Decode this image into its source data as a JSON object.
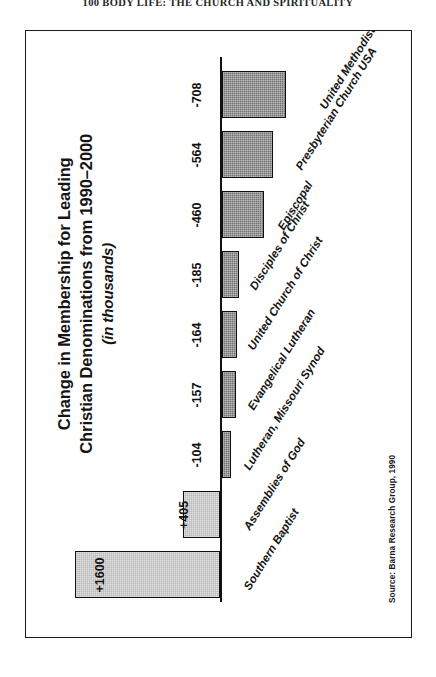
{
  "page": {
    "running_head": "100  BODY LIFE: THE CHURCH AND SPIRITUALITY"
  },
  "figure": {
    "title": "Change in Membership for Leading",
    "title_line2": "Christian Denominations from 1990–2000",
    "subtitle": "(in thousands)",
    "source": "Source: Barna Research Group, 1990",
    "colors": {
      "negative_bar": "#6f6f6f",
      "positive_bar": "#b6b6b6",
      "axis": "#111111",
      "frame": "#1a1a1a",
      "text": "#141414"
    }
  },
  "chart_data": {
    "type": "bar",
    "orientation": "horizontal",
    "title": "Change in Membership for Leading Christian Denominations from 1990–2000 (in thousands)",
    "xlabel": "",
    "ylabel": "",
    "units": "thousands",
    "source": "Source: Barna Research Group, 1990",
    "grid": false,
    "legend": false,
    "categories": [
      "United Methodist",
      "Presbyterian Church USA",
      "Episcopal",
      "Disciples of Christ",
      "United Church of Christ",
      "Evangelical Lutheran",
      "Lutheran, Missouri Synod",
      "Assemblies of God",
      "Southern Baptist"
    ],
    "values": [
      -708,
      -564,
      -460,
      -185,
      -164,
      -157,
      -104,
      405,
      1600
    ],
    "value_labels": [
      "-708",
      "-564",
      "-460",
      "-185",
      "-164",
      "-157",
      "-104",
      "+405",
      "+1600"
    ],
    "xlim": [
      -900,
      1700
    ]
  }
}
